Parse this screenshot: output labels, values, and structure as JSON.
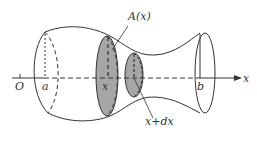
{
  "figure": {
    "type": "solid-of-revolution-cross-section",
    "axis_label": "x",
    "origin_label": "O",
    "left_bound_label": "a",
    "right_bound_label": "b",
    "section_label": "x",
    "area_label": "A(x)",
    "next_section_label": "x+dx"
  },
  "colors": {
    "stroke": "#333333",
    "shade": "#a6a6a6",
    "background": "#ffffff"
  }
}
